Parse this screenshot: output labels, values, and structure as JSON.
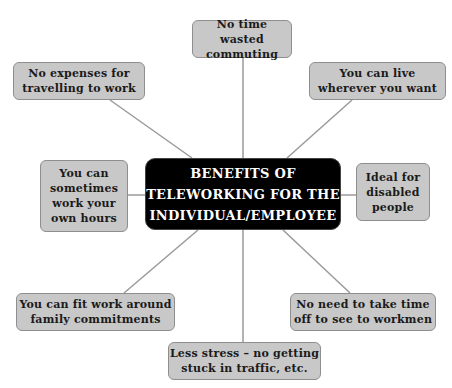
{
  "diagram": {
    "type": "mind-map",
    "colors": {
      "center_fill": "#000000",
      "center_text": "#ffffff",
      "node_fill": "#c8c8c8",
      "node_border": "#8e8e8e",
      "connector": "#9a9a9a"
    },
    "center": {
      "lines": [
        "BENEFITS OF",
        "TELEWORKING FOR THE",
        "INDIVIDUAL/EMPLOYEE"
      ]
    },
    "nodes": [
      {
        "id": "commute",
        "lines": [
          "No time wasted",
          "commuting"
        ]
      },
      {
        "id": "expenses",
        "lines": [
          "No expenses for",
          "travelling to work"
        ]
      },
      {
        "id": "live",
        "lines": [
          "You can live",
          "wherever you want"
        ]
      },
      {
        "id": "hours",
        "lines": [
          "You can",
          "sometimes",
          "work your",
          "own hours"
        ]
      },
      {
        "id": "disabled",
        "lines": [
          "Ideal for",
          "disabled",
          "people"
        ]
      },
      {
        "id": "family",
        "lines": [
          "You can fit work around",
          "family commitments"
        ]
      },
      {
        "id": "workmen",
        "lines": [
          "No need to take time",
          "off to see to workmen"
        ]
      },
      {
        "id": "stress",
        "lines": [
          "Less stress – no getting",
          "stuck in traffic, etc."
        ]
      }
    ]
  }
}
